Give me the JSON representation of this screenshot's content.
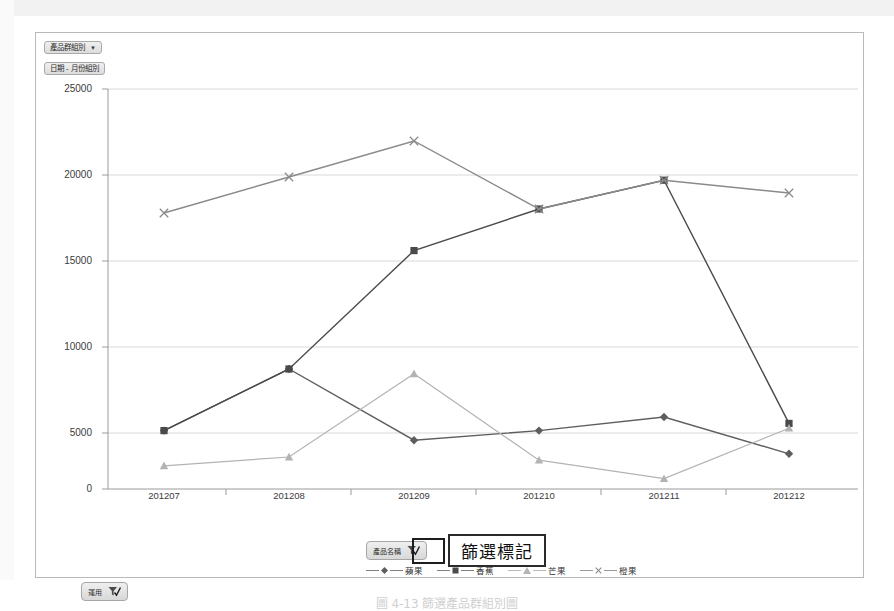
{
  "window": {
    "field_buttons": [
      {
        "name": "product-group-field",
        "label": "產品群組別",
        "has_caret": true
      },
      {
        "name": "date-month-field",
        "label": "日期 - 月份組別",
        "has_caret": false
      }
    ]
  },
  "annotation": {
    "text": "篩選標記",
    "highlight_target": "legend-slicer-filter-icon"
  },
  "slicers": [
    {
      "name": "slicer-bottom-left",
      "label": "運用",
      "icon": "filter-check-icon"
    },
    {
      "name": "slicer-legend",
      "label": "產品名稱",
      "icon": "filter-check-icon"
    }
  ],
  "caption": "圖 4-13 篩選產品群組別圖",
  "colors": {
    "series1": "#5e5e5e",
    "series2": "#4a4a4a",
    "series3": "#b3b3b3",
    "series4": "#8a8a8a",
    "grid": "#d6d6d6",
    "axis": "#9a9a9a",
    "frame": "#b9b9b9",
    "annotation_border": "#2b2b2b"
  },
  "chart_data": {
    "type": "line",
    "title": "",
    "xlabel": "",
    "ylabel": "",
    "grid": true,
    "legend_position": "bottom",
    "ylim": [
      0,
      25000
    ],
    "yticks": [
      0,
      5000,
      10000,
      15000,
      20000,
      25000
    ],
    "ytick_labels": [
      "0",
      "5000",
      "10000",
      "15000",
      "20000",
      "25000"
    ],
    "categories": [
      "201207",
      "201208",
      "201209",
      "201210",
      "201211",
      "201212"
    ],
    "series": [
      {
        "name": "蘋果",
        "marker": "diamond",
        "color": "#5e5e5e",
        "values": [
          3650,
          7500,
          3050,
          3650,
          4500,
          2200
        ]
      },
      {
        "name": "香蕉",
        "marker": "square",
        "color": "#4a4a4a",
        "values": [
          3650,
          7500,
          14900,
          17500,
          19300,
          4100
        ]
      },
      {
        "name": "芒果",
        "marker": "triangle",
        "color": "#b3b3b3",
        "values": [
          1450,
          2000,
          7200,
          1800,
          650,
          3800
        ]
      },
      {
        "name": "橙果",
        "marker": "cross",
        "color": "#8a8a8a",
        "values": [
          17250,
          19500,
          21750,
          17500,
          19300,
          18500
        ]
      }
    ]
  }
}
